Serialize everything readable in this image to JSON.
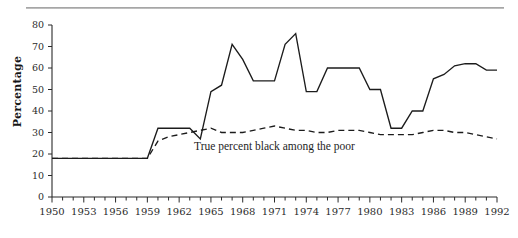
{
  "figure": {
    "has_top_rule": true,
    "background_color": "#ffffff",
    "line_color": "#1c1c1c"
  },
  "chart_data": {
    "type": "line",
    "title": "",
    "subtitle": "",
    "xlabel": "",
    "ylabel": "Percentage",
    "xlim": [
      1950,
      1992
    ],
    "ylim": [
      0,
      80
    ],
    "grid": false,
    "legend_position": "inline-annotation",
    "y_ticks": [
      0,
      10,
      20,
      30,
      40,
      50,
      60,
      70,
      80
    ],
    "y_tick_labels": [
      "0",
      "10",
      "20",
      "30",
      "40",
      "50",
      "60",
      "70",
      "80"
    ],
    "x_ticks": [
      1950,
      1951,
      1952,
      1953,
      1954,
      1955,
      1956,
      1957,
      1958,
      1959,
      1960,
      1961,
      1962,
      1963,
      1964,
      1965,
      1966,
      1967,
      1968,
      1969,
      1970,
      1971,
      1972,
      1973,
      1974,
      1975,
      1976,
      1977,
      1978,
      1979,
      1980,
      1981,
      1982,
      1983,
      1984,
      1985,
      1986,
      1987,
      1988,
      1989,
      1990,
      1991,
      1992
    ],
    "x_tick_labels": [
      "1950",
      "1953",
      "1956",
      "1959",
      "1962",
      "1965",
      "1968",
      "1971",
      "1974",
      "1977",
      "1980",
      "1983",
      "1986",
      "1989",
      "1992"
    ],
    "x_label_interval": 3,
    "x": [
      1950,
      1951,
      1952,
      1953,
      1954,
      1955,
      1956,
      1957,
      1958,
      1959,
      1960,
      1961,
      1962,
      1963,
      1964,
      1965,
      1966,
      1967,
      1968,
      1969,
      1970,
      1971,
      1972,
      1973,
      1974,
      1975,
      1976,
      1977,
      1978,
      1979,
      1980,
      1981,
      1982,
      1983,
      1984,
      1985,
      1986,
      1987,
      1988,
      1989,
      1990,
      1991,
      1992
    ],
    "series": [
      {
        "name": "Perceived percent black among the poor",
        "style": "solid",
        "annotation": "",
        "values": [
          18,
          18,
          18,
          18,
          18,
          18,
          18,
          18,
          18,
          18,
          32,
          32,
          32,
          32,
          27,
          49,
          52,
          71,
          64,
          54,
          54,
          54,
          71,
          76,
          49,
          49,
          60,
          60,
          60,
          60,
          50,
          50,
          32,
          32,
          40,
          40,
          55,
          57,
          61,
          62,
          62,
          59,
          59
        ]
      },
      {
        "name": "True percent black among the poor",
        "style": "dashed",
        "annotation": "True percent black among the poor",
        "values": [
          18,
          18,
          18,
          18,
          18,
          18,
          18,
          18,
          18,
          18,
          26,
          28,
          29,
          30,
          31,
          32,
          30,
          30,
          30,
          31,
          32,
          33,
          32,
          31,
          31,
          30,
          30,
          31,
          31,
          31,
          30,
          29,
          29,
          29,
          29,
          30,
          31,
          31,
          30,
          30,
          29,
          28,
          27
        ]
      }
    ],
    "annotations": [
      {
        "text": "True percent black among the poor",
        "x": 1971,
        "y": 22
      }
    ]
  }
}
